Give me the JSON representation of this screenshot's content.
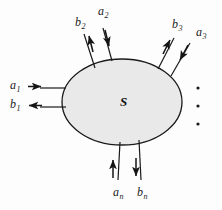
{
  "figure": {
    "network_label": "S",
    "background_color": "#fdfdfd",
    "body_fill_color": "#e9e9e9",
    "stroke_color": "#1a1a1a",
    "ellipsis_symbol": "•"
  },
  "body": {
    "shape": "ellipse",
    "cx": 122,
    "cy": 102,
    "rx": 60,
    "ry": 43
  },
  "ports": [
    {
      "id": "port-1",
      "side": "left",
      "incident": {
        "name": "a",
        "subscript": "1",
        "label": "a",
        "direction": "into-network"
      },
      "reflected": {
        "name": "b",
        "subscript": "1",
        "label": "b",
        "direction": "out-of-network"
      }
    },
    {
      "id": "port-2",
      "side": "top-left",
      "incident": {
        "name": "a",
        "subscript": "2",
        "label": "a",
        "direction": "into-network"
      },
      "reflected": {
        "name": "b",
        "subscript": "2",
        "label": "b",
        "direction": "out-of-network"
      }
    },
    {
      "id": "port-3",
      "side": "top-right",
      "incident": {
        "name": "a",
        "subscript": "3",
        "label": "a",
        "direction": "into-network"
      },
      "reflected": {
        "name": "b",
        "subscript": "3",
        "label": "b",
        "direction": "out-of-network"
      }
    },
    {
      "id": "port-n",
      "side": "bottom",
      "incident": {
        "name": "a",
        "subscript": "n",
        "label": "a",
        "direction": "into-network"
      },
      "reflected": {
        "name": "b",
        "subscript": "n",
        "label": "b",
        "direction": "out-of-network"
      }
    }
  ],
  "labels": {
    "a1": {
      "base": "a",
      "sub": "1"
    },
    "b1": {
      "base": "b",
      "sub": "1"
    },
    "a2": {
      "base": "a",
      "sub": "2"
    },
    "b2": {
      "base": "b",
      "sub": "2"
    },
    "a3": {
      "base": "a",
      "sub": "3"
    },
    "b3": {
      "base": "b",
      "sub": "3"
    },
    "an": {
      "base": "a",
      "sub": "n"
    },
    "bn": {
      "base": "b",
      "sub": "n"
    }
  },
  "ellipsis": {
    "orientation": "vertical",
    "dot_count": 3,
    "meaning": "additional-ports"
  }
}
